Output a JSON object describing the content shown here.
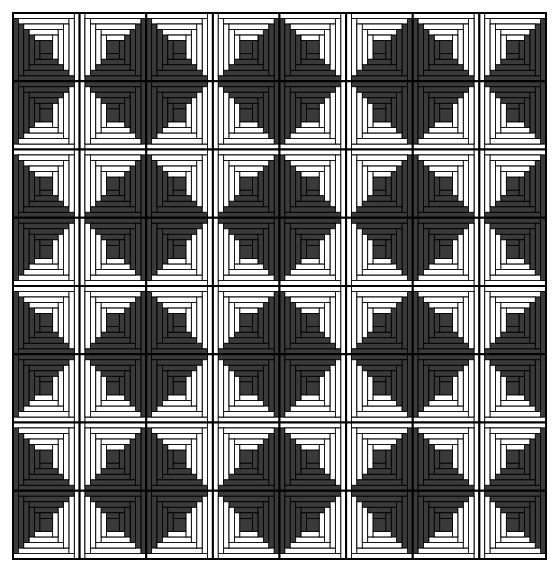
{
  "pattern": {
    "style": "log-cabin",
    "rows": 8,
    "cols": 8,
    "origin": [
      13,
      13
    ],
    "extent": [
      546,
      559
    ],
    "rings": 5,
    "center_ratio": 0.19,
    "colors": {
      "dark": "#3a3a3a",
      "light": "#ffffff",
      "outline": "#000000",
      "background": "#ffffff"
    },
    "row_light_side": [
      "top",
      "bottom",
      "top",
      "bottom",
      "top",
      "bottom",
      "top",
      "bottom"
    ],
    "col_light_side": [
      "right",
      "left",
      "right",
      "left",
      "right",
      "left",
      "right",
      "left"
    ]
  }
}
